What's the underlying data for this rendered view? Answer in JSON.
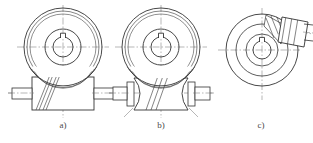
{
  "figure": {
    "background_color": "#ffffff",
    "line_color": "#333333",
    "centerline_color": "#666666",
    "label_color": "#4a4a4a",
    "panels": [
      {
        "id": "a",
        "label": "a)",
        "description": "Cylindrical worm with cylindrical worm wheel, front view",
        "center_x": 63,
        "center_y": 47,
        "wheel": {
          "outer_radius": 39,
          "rim_radius": 36,
          "hub_outer_radius": 18,
          "bore_radius": 10,
          "keyway_width": 5,
          "keyway_depth": 5
        },
        "worm": {
          "type": "cylindrical",
          "body_left": 32,
          "body_right": 94,
          "body_top": 77,
          "body_bottom": 110,
          "shaft_left": 12,
          "shaft_right": 114,
          "shaft_top": 88,
          "shaft_bottom": 99,
          "thread_lines": 4,
          "axis_y": 93
        }
      },
      {
        "id": "b",
        "label": "b)",
        "description": "Globoid (hourglass) worm with cylindrical worm wheel, front view",
        "center_x": 161,
        "center_y": 47,
        "wheel": {
          "outer_radius": 39,
          "rim_radius": 36,
          "hub_outer_radius": 18,
          "bore_radius": 10,
          "keyway_width": 5,
          "keyway_depth": 5
        },
        "worm": {
          "type": "globoid",
          "body_left": 134,
          "body_right": 188,
          "body_top": 78,
          "body_bottom": 110,
          "throat_radius": 12,
          "shaft_left": 113,
          "shaft_right": 210,
          "shaft_top": 88,
          "shaft_bottom": 99,
          "thread_lines": 3,
          "axis_y": 93
        }
      },
      {
        "id": "c",
        "label": "c)",
        "description": "Worm wheel top view with worm engaging at an angle",
        "center_x": 262,
        "center_y": 50,
        "wheel": {
          "outer_radius": 36,
          "rim_radius": 26,
          "hub_outer_radius": 16,
          "bore_radius": 9,
          "keyway_width": 5,
          "keyway_depth": 5
        },
        "worm": {
          "type": "inclined",
          "angle_deg": -20,
          "thread_lines": 3,
          "shaft_end_x": 311,
          "axis_y": 31
        }
      }
    ]
  }
}
